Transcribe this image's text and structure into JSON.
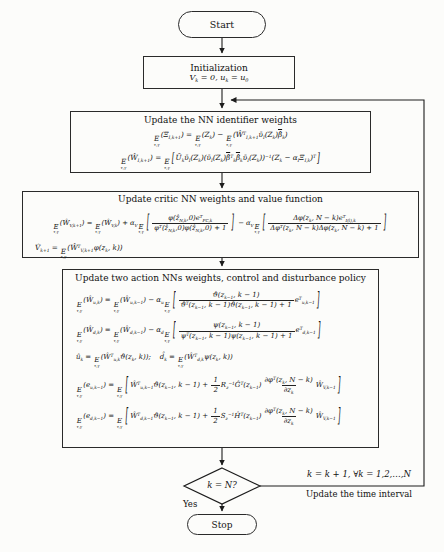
{
  "flowchart": {
    "start": {
      "label": "Start"
    },
    "init": {
      "title": "Initialization",
      "eq_html": "V<sub>k</sub> = 0, u<sub>k</sub> = u<sub>0</sub>"
    },
    "identifier": {
      "title": "Update the NN identifier weights",
      "eq1_html": "<span class='E'>E<span class='es'>τ,γ</span></span>(Ξ<sub>I,k+1</sub>) = <span class='E'>E<span class='es'>τ,γ</span></span>(Z<sub>k</sub>) − <span class='E'>E<span class='es'>τ,γ</span></span>(Ŵ<sup>T</sup><sub>I,k+1</sub>ῡ<sub>I</sub>(Z<sub>k</sub>)<span class='ov'>β̂</span><sub>k</sub>)",
      "eq2_html": "<span class='E'>E<span class='es'>τ,γ</span></span>(Ŵ<sub>I,k+1</sub>) = <span class='E'>E<span class='es'>τ,γ</span></span><span class='bk'>[</span>Ū<sub>k</sub>ῡ<sub>I</sub>(Z<sub>k</sub>)(ῡ<sub>I</sub>(Z<sub>k</sub>)<span class='ov'>β̂</span><sup>T</sup><sub>k</sub><span class='ov'>β̂</span><sub>k</sub>ῡ<sub>I</sub>(Z<sub>k</sub>))<sup>−1</sup>(Z<sub>k</sub> − α<sub>I</sub>Ξ<sub>I,k</sub>)<sup>T</sup><span class='bk'>]</span>"
    },
    "critic": {
      "title": "Update critic NN weights and value function",
      "eq1_html": "<span class='E'>E<span class='es'>τ,γ</span></span>(Ŵ<sub>V,k+1</sub>) = <span class='E'>E<span class='es'>τ,γ</span></span>(Ŵ<sub>V,k</sub>) + α<sub>V</sub><span class='E'>E<span class='es'>τ,γ</span></span><span class='bk2'>[</span><span class='frac'><span class='fn'>φ(ẑ<sub>N,k</sub>,0)e<sup>T</sup><sub>FC,k</sub></span><span class='fd'>φ<sup>T</sup>(ẑ<sub>N,k</sub>,0)φ(ẑ<sub>N,k</sub>,0) + 1</span></span><span class='bk2'>]</span> − α<sub>V</sub><span class='E'>E<span class='es'>τ,γ</span></span><span class='bk2'>[</span><span class='frac'><span class='fn'>Δφ(z<sub>k</sub>, N − k)e<sup>T</sup><sub>I(l),k</sub></span><span class='fd'>Δφ<sup>T</sup>(z<sub>k</sub>, N − k)Δφ(z<sub>k</sub>, N − k) + 1</span></span><span class='bk2'>]</span>",
      "eq2_html": "V̂<sub>k+1</sub> = <span class='E'>E<span class='es'>τ,γ</span></span>(Ŵ<sup>T</sup><sub>V,k+1</sub>φ(z<sub>k</sub>, k))"
    },
    "action": {
      "title": "Update two action NNs weights, control and disturbance policy",
      "eq1_html": "<span class='E'>E<span class='es'>τ,γ</span></span>(Ŵ<sub>u,k</sub>) = <span class='E'>E<span class='es'>τ,γ</span></span>(Ŵ<sub>u,k−1</sub>) − α<sub>u</sub><span class='E'>E<span class='es'>τ,γ</span></span><span class='bk2'>[</span><span class='frac'><span class='fn'>ϑ(z<sub>k−1</sub>, k − 1)</span><span class='fd'>ϑ<sup>T</sup>(z<sub>k−1</sub>, k − 1)ϑ(z<sub>k−1</sub>, k − 1) + 1</span></span>e<sup>T</sup><sub>u,k−1</sub><span class='bk2'>]</span>",
      "eq2_html": "<span class='E'>E<span class='es'>τ,γ</span></span>(Ŵ<sub>d,k</sub>) = <span class='E'>E<span class='es'>τ,γ</span></span>(Ŵ<sub>d,k−1</sub>) − α<sub>d</sub><span class='E'>E<span class='es'>τ,γ</span></span><span class='bk2'>[</span><span class='frac'><span class='fn'>ψ(z<sub>k−1</sub>, k − 1)</span><span class='fd'>ψ<sup>T</sup>(z<sub>k−1</sub>, k − 1)ψ(z<sub>k−1</sub>, k − 1) + 1</span></span>e<sup>T</sup><sub>d,k−1</sub><span class='bk2'>]</span>",
      "eq3_html": "û<sub>k</sub> = <span class='E'>E<span class='es'>τ,γ</span></span>(Ŵ<sup>T</sup><sub>u,k</sub>ϑ(z<sub>k</sub>, k));&nbsp;&nbsp;&nbsp;&nbsp;d̂<sub>k</sub> = <span class='E'>E<span class='es'>τ,γ</span></span>(Ŵ<sup>T</sup><sub>d,k</sub>ψ(z<sub>k</sub>, k))",
      "eq4_html": "<span class='E'>E<span class='es'>τ,γ</span></span>(e<sub>u,k−1</sub>) = <span class='E'>E<span class='es'>τ,γ</span></span><span class='bk2'>[</span>Ŵ<sup>T</sup><sub>u,k−1</sub>ϑ(z<sub>k−1</sub>, k − 1) + <span class='frac'><span class='fn'>1</span><span class='fd'>2</span></span>R<sub>z</sub><sup>−1</sup>Ĝ<sup>T</sup>(z<sub>k−1</sub>)<span class='frac'><span class='fn'>∂φ<sup>T</sup>(z<sub>k</sub>, N − k)</span><span class='fd'>∂z<sub>k</sub></span></span>Ŵ<sub>V,k−1</sub><span class='bk2'>]</span>",
      "eq5_html": "<span class='E'>E<span class='es'>τ,γ</span></span>(e<sub>d,k−1</sub>) = <span class='E'>E<span class='es'>τ,γ</span></span><span class='bk2'>[</span>Ŵ<sup>T</sup><sub>d,k−1</sub>ϑ(z<sub>k−1</sub>, k − 1) + <span class='frac'><span class='fn'>1</span><span class='fd'>2</span></span>S<sub>z</sub><sup>−1</sup>Ĥ<sup>T</sup>(z<sub>k−1</sub>)<span class='frac'><span class='fn'>∂φ<sup>T</sup>(z<sub>k</sub>, N − k)</span><span class='fd'>∂z<sub>k</sub></span></span>Ŵ<sub>V,k−1</sub><span class='bk2'>]</span>"
    },
    "decision": {
      "label": "k = N?"
    },
    "yes_label": "Yes",
    "stop": {
      "label": "Stop"
    },
    "loop": {
      "line1": "k = k + 1, ∀k = 1,2,…,N",
      "line2": "Update the time interval"
    }
  },
  "colors": {
    "line": "#1c1c1c",
    "background": "#fcfcfa",
    "text": "#141414"
  }
}
